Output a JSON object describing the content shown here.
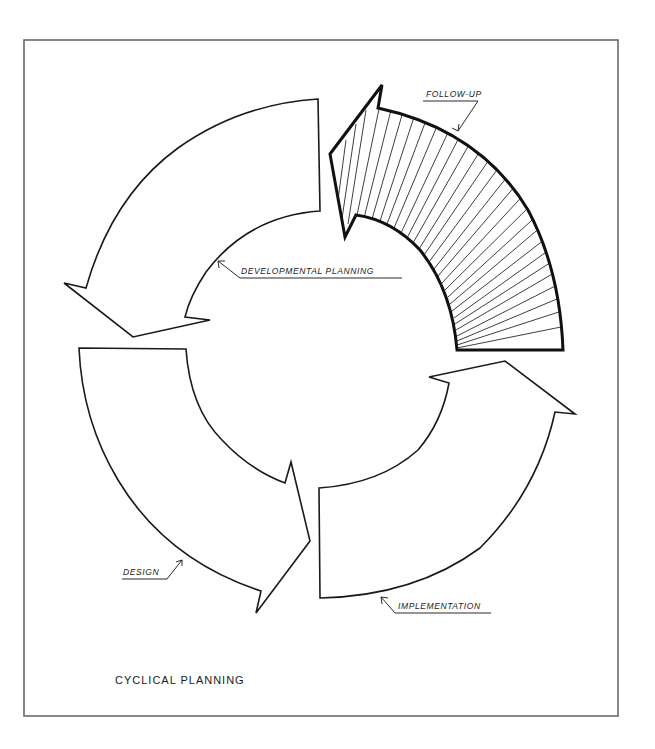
{
  "diagram": {
    "title": "CYCLICAL PLANNING",
    "type": "cycle",
    "stages": [
      {
        "id": "developmental-planning",
        "label": "DEVELOPMENTAL PLANNING",
        "position": "top-left",
        "style": "outline",
        "points_to": "design"
      },
      {
        "id": "design",
        "label": "DESIGN",
        "position": "bottom-left",
        "style": "outline",
        "points_to": "implementation"
      },
      {
        "id": "implementation",
        "label": "IMPLEMENTATION",
        "position": "bottom-right",
        "style": "outline",
        "points_to": "follow-up"
      },
      {
        "id": "follow-up",
        "label": "FOLLOW-UP",
        "position": "top-right",
        "style": "hatched",
        "points_to": "developmental-planning"
      }
    ],
    "direction": "counter-clockwise",
    "colors": {
      "stroke": "#1a1a1a",
      "frame": "#6a6a6a",
      "background": "#ffffff"
    }
  }
}
